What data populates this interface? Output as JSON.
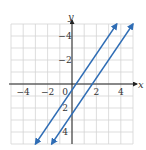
{
  "chart_data": {
    "type": "line",
    "title": "",
    "xlabel": "x",
    "ylabel": "y",
    "xlim": [
      -5,
      5
    ],
    "ylim": [
      -5,
      5
    ],
    "grid": true,
    "xticks": [
      -4,
      -2,
      0,
      2,
      4
    ],
    "yticks": [
      -4,
      -2,
      2,
      4
    ],
    "xtick_labels": [
      "−4",
      "−2",
      "0",
      "2",
      "4"
    ],
    "ytick_labels": [
      "4",
      "2",
      "−2",
      "−4"
    ],
    "series": [
      {
        "name": "line 1",
        "slope": 1.5,
        "intercept": -0.5,
        "x": [
          -3,
          3.67
        ],
        "y": [
          -5,
          5
        ],
        "color": "#2f6db5",
        "arrows": "both"
      },
      {
        "name": "line 2",
        "slope": 1.5,
        "intercept": -2.5,
        "x": [
          -1.67,
          5
        ],
        "y": [
          -5,
          5
        ],
        "color": "#2f6db5",
        "arrows": "both"
      }
    ],
    "legend": null
  },
  "colors": {
    "grid": "#d4d4d4",
    "axis": "#222222",
    "line": "#2f6db5"
  }
}
